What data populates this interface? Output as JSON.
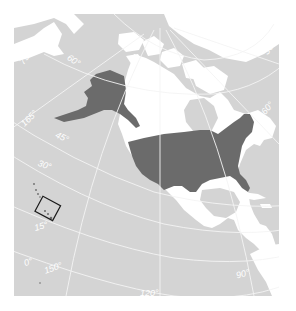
{
  "map": {
    "subject": "United States locator map",
    "colors": {
      "ocean": "#d4d4d4",
      "other_land": "#ffffff",
      "highlight_country": "#6b6b6b",
      "graticule": "#f4f4f4",
      "inset_box": "#1a1a1a",
      "page_background": "#ffffff"
    },
    "highlighted_region": "United States (contiguous + Alaska)",
    "inset": {
      "region": "Hawaii",
      "style": "black outline box"
    },
    "latitude_labels": {
      "lat75": "75°",
      "lat60": "60°",
      "lat45": "45°",
      "lat30": "30°",
      "lat15": "15°",
      "lat0": "0°"
    },
    "longitude_labels": {
      "lon165": "165°",
      "lon150": "150°",
      "lon120": "120°",
      "lon90": "90°",
      "lon60": "60°",
      "lon30": "30°"
    }
  }
}
